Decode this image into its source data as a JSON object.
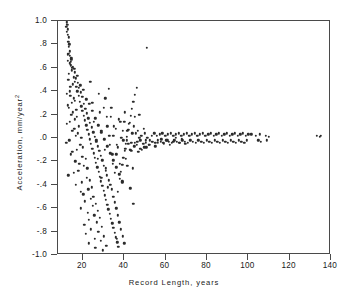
{
  "chart_data": {
    "type": "scatter",
    "title": "",
    "xlabel": "Record Length, years",
    "ylabel": "Acceleration, mm/year",
    "ylabel_superscript": "2",
    "xlim": [
      8,
      140
    ],
    "ylim": [
      -1.0,
      1.0
    ],
    "xticks": [
      20,
      40,
      60,
      80,
      100,
      120,
      140
    ],
    "xticklabels": [
      "20",
      "40",
      "60",
      "80",
      "100",
      "120",
      "140"
    ],
    "yticks": [
      1.0,
      0.8,
      0.6,
      0.4,
      0.2,
      0.0,
      -0.2,
      -0.4,
      -0.6,
      -0.8,
      -1.0
    ],
    "yticklabels": [
      "1.0",
      ".8",
      ".6",
      ".4",
      ".2",
      ".0",
      "-.2",
      "-.4",
      "-.6",
      "-.8",
      "-1.0"
    ],
    "grid": false,
    "legend": false,
    "marker_color": "#2b2b2b",
    "frame_color": "#4a4a4a",
    "background": "#ffffff",
    "x": [
      12.2,
      12.5,
      12.8,
      13.1,
      13.4,
      13.0,
      12.6,
      13.8,
      14.2,
      14.6,
      13.2,
      12.9,
      15.1,
      14.0,
      13.6,
      12.4,
      13.9,
      15.6,
      16.2,
      14.8,
      12.7,
      13.3,
      16.8,
      15.3,
      14.4,
      17.2,
      16.0,
      13.7,
      12.3,
      18.1,
      15.8,
      14.9,
      17.6,
      16.5,
      19.2,
      13.5,
      12.1,
      18.7,
      20.1,
      17.0,
      15.0,
      14.1,
      19.8,
      21.3,
      16.3,
      18.3,
      20.6,
      22.1,
      17.9,
      15.5,
      13.0,
      21.8,
      23.4,
      19.5,
      16.7,
      24.2,
      22.6,
      18.9,
      20.3,
      25.1,
      23.8,
      21.0,
      26.3,
      24.7,
      19.1,
      27.2,
      22.3,
      25.6,
      28.1,
      23.0,
      26.8,
      20.8,
      29.3,
      24.0,
      27.5,
      21.5,
      30.2,
      25.9,
      28.7,
      22.8,
      31.4,
      26.1,
      29.8,
      23.6,
      32.6,
      27.8,
      30.9,
      24.5,
      33.8,
      28.3,
      31.7,
      25.3,
      35.1,
      29.0,
      32.8,
      26.6,
      36.4,
      30.5,
      34.2,
      27.1,
      37.8,
      31.2,
      35.6,
      28.9,
      39.1,
      32.1,
      36.9,
      30.1,
      40.3,
      33.5,
      38.2,
      31.8,
      41.6,
      34.8,
      39.5,
      33.0,
      42.9,
      36.1,
      40.8,
      34.4,
      44.2,
      37.4,
      42.1,
      35.9,
      45.5,
      38.7,
      43.4,
      37.0,
      46.8,
      40.0,
      44.7,
      39.3,
      48.1,
      41.3,
      46.0,
      42.6,
      49.4,
      43.9,
      47.3,
      45.2,
      50.7,
      46.5,
      48.6,
      47.8,
      52.0,
      49.9,
      51.2,
      50.4,
      53.3,
      52.5,
      54.6,
      53.8,
      55.9,
      55.1,
      57.2,
      56.4,
      58.5,
      57.7,
      59.8,
      59.0,
      61.1,
      60.3,
      62.4,
      61.6,
      63.7,
      62.9,
      65.0,
      64.2,
      66.3,
      65.5,
      67.6,
      66.8,
      68.9,
      68.1,
      70.2,
      69.4,
      71.5,
      70.7,
      72.8,
      72.0,
      74.1,
      73.3,
      75.4,
      74.6,
      76.7,
      75.9,
      78.0,
      77.2,
      79.3,
      78.5,
      80.6,
      79.8,
      81.9,
      81.1,
      83.2,
      82.4,
      84.5,
      83.7,
      85.8,
      85.0,
      87.1,
      86.3,
      88.4,
      87.6,
      89.7,
      88.9,
      91.0,
      90.2,
      92.3,
      91.5,
      93.6,
      92.8,
      94.9,
      94.1,
      96.2,
      95.4,
      97.5,
      96.7,
      98.8,
      98.0,
      100.1,
      99.3,
      101.4,
      103.5,
      104.8,
      105.6,
      106.2,
      108.4,
      109.1,
      110.0,
      133.2,
      134.5,
      135.1,
      12.0,
      12.6,
      13.2,
      13.8,
      14.4,
      15.0,
      15.6,
      16.2,
      16.8,
      17.4,
      18.0,
      18.6,
      19.2,
      19.8,
      20.4,
      21.0,
      21.6,
      22.2,
      22.8,
      23.4,
      24.0,
      24.6,
      25.2,
      25.8,
      26.4,
      27.0,
      27.6,
      28.2,
      28.8,
      29.4,
      30.0,
      30.6,
      31.2,
      31.8,
      32.4,
      33.0,
      33.6,
      34.2,
      34.8,
      35.4,
      36.0,
      36.6,
      37.2,
      37.8,
      38.4,
      39.0,
      39.6,
      40.2,
      40.8,
      41.4,
      42.0,
      42.6,
      43.2,
      43.8,
      44.4,
      45.0,
      46.2,
      47.4,
      48.6,
      49.8,
      12.3,
      13.0,
      13.7,
      14.5,
      15.2,
      16.0,
      16.7,
      17.5,
      18.2,
      19.0,
      19.7,
      20.5,
      21.2,
      22.0,
      22.7,
      23.5,
      24.2,
      25.0,
      25.7,
      26.5,
      27.2,
      28.0,
      28.7,
      29.5,
      30.2,
      31.0,
      31.7,
      32.5,
      33.2,
      34.0,
      34.7,
      35.5,
      36.2,
      37.0,
      37.7,
      38.5,
      39.2,
      40.0,
      41.5,
      43.0,
      44.5,
      51.0,
      45.2,
      36.5,
      12.8,
      14.1,
      15.9,
      17.3,
      18.8,
      20.2,
      21.7,
      23.1,
      24.6,
      26.0,
      27.5,
      28.9,
      30.4,
      31.8,
      33.3,
      34.7,
      36.2,
      37.6,
      39.1,
      40.5,
      42.0,
      43.4,
      44.9,
      46.3,
      47.8,
      49.2,
      50.6,
      52.1,
      53.5,
      55.0,
      56.4,
      57.9,
      59.3,
      60.8,
      62.2,
      63.7,
      65.1,
      66.6,
      68.0,
      69.5
    ],
    "y": [
      0.99,
      0.97,
      0.93,
      0.86,
      0.8,
      0.72,
      0.66,
      0.64,
      0.62,
      0.58,
      0.55,
      0.5,
      0.46,
      0.44,
      0.4,
      0.38,
      0.36,
      0.34,
      0.32,
      0.3,
      0.28,
      0.26,
      0.24,
      0.22,
      0.2,
      0.18,
      0.16,
      0.14,
      0.12,
      0.1,
      0.08,
      0.06,
      0.04,
      0.02,
      0.0,
      -0.02,
      -0.04,
      -0.06,
      -0.08,
      -0.1,
      -0.12,
      -0.14,
      -0.16,
      -0.18,
      -0.2,
      -0.22,
      -0.24,
      -0.26,
      -0.28,
      -0.3,
      -0.32,
      -0.34,
      -0.36,
      -0.38,
      -0.4,
      -0.42,
      -0.44,
      -0.46,
      -0.48,
      -0.5,
      -0.52,
      -0.54,
      -0.56,
      -0.58,
      -0.6,
      -0.62,
      -0.64,
      -0.66,
      -0.68,
      -0.7,
      -0.72,
      -0.74,
      -0.76,
      -0.78,
      -0.8,
      -0.82,
      -0.84,
      -0.86,
      -0.88,
      -0.9,
      -0.92,
      -0.94,
      -0.96,
      0.48,
      0.42,
      0.38,
      0.34,
      0.3,
      0.26,
      0.22,
      0.18,
      0.14,
      0.1,
      0.06,
      0.02,
      -0.02,
      -0.06,
      -0.1,
      -0.14,
      -0.18,
      -0.22,
      -0.26,
      -0.3,
      -0.34,
      -0.38,
      -0.42,
      -0.46,
      0.26,
      0.22,
      0.18,
      0.14,
      0.1,
      0.06,
      0.02,
      -0.02,
      -0.06,
      -0.1,
      -0.14,
      -0.18,
      -0.22,
      -0.26,
      0.16,
      0.12,
      0.08,
      0.04,
      0.0,
      -0.04,
      -0.08,
      -0.12,
      0.14,
      0.1,
      0.06,
      0.02,
      -0.02,
      -0.06,
      -0.1,
      0.08,
      0.04,
      0.0,
      -0.04,
      -0.08,
      0.06,
      0.02,
      -0.02,
      -0.06,
      0.04,
      0.0,
      -0.04,
      0.02,
      -0.02,
      0.04,
      -0.03,
      0.02,
      -0.04,
      0.03,
      -0.02,
      0.04,
      -0.03,
      0.02,
      -0.04,
      0.03,
      -0.02,
      0.04,
      -0.03,
      0.02,
      -0.04,
      0.03,
      -0.02,
      0.04,
      -0.03,
      0.02,
      -0.04,
      0.03,
      -0.02,
      0.04,
      -0.03,
      0.02,
      -0.04,
      0.03,
      -0.02,
      0.04,
      -0.03,
      0.02,
      -0.04,
      0.03,
      -0.02,
      0.04,
      -0.03,
      0.02,
      -0.04,
      0.03,
      -0.02,
      0.04,
      -0.03,
      0.02,
      -0.04,
      0.03,
      -0.02,
      0.04,
      -0.03,
      0.02,
      -0.04,
      0.03,
      -0.02,
      0.04,
      -0.03,
      0.02,
      -0.04,
      0.03,
      -0.02,
      0.04,
      -0.03,
      0.02,
      -0.04,
      0.03,
      -0.02,
      0.04,
      -0.03,
      0.02,
      -0.04,
      0.03,
      -0.02,
      0.03,
      0.02,
      -0.02,
      0.03,
      -0.03,
      0.02,
      -0.02,
      0.01,
      0.02,
      0.01,
      0.02,
      0.95,
      0.88,
      0.78,
      0.7,
      0.68,
      0.6,
      0.52,
      0.48,
      0.44,
      0.4,
      0.36,
      0.31,
      0.27,
      0.23,
      0.19,
      0.15,
      0.11,
      0.07,
      0.03,
      -0.01,
      -0.05,
      -0.09,
      -0.13,
      -0.17,
      -0.21,
      -0.25,
      -0.29,
      -0.33,
      -0.37,
      -0.41,
      -0.45,
      -0.49,
      -0.53,
      -0.57,
      -0.61,
      -0.65,
      -0.69,
      -0.73,
      -0.77,
      -0.81,
      -0.85,
      -0.89,
      -0.93,
      -0.35,
      -0.29,
      -0.23,
      -0.17,
      -0.11,
      -0.05,
      0.01,
      0.07,
      0.13,
      0.19,
      0.25,
      0.31,
      0.37,
      0.43,
      0.2,
      -0.1,
      -0.08,
      0.91,
      0.82,
      0.74,
      0.67,
      0.61,
      0.56,
      0.51,
      0.47,
      0.43,
      0.39,
      0.35,
      0.29,
      0.25,
      0.21,
      0.17,
      0.13,
      0.09,
      0.05,
      0.01,
      -0.03,
      -0.07,
      -0.11,
      -0.15,
      -0.19,
      -0.24,
      -0.28,
      -0.32,
      -0.36,
      -0.4,
      -0.44,
      -0.5,
      -0.55,
      -0.6,
      -0.66,
      -0.72,
      -0.78,
      -0.84,
      -0.9,
      -0.24,
      -0.43,
      -0.56,
      0.77,
      0.18,
      -0.86,
      0.71,
      0.65,
      0.59,
      0.53,
      0.45,
      0.41,
      0.33,
      0.29,
      0.23,
      0.17,
      0.11,
      0.05,
      -0.01,
      -0.07,
      -0.13,
      -0.19,
      -0.25,
      -0.31,
      -0.37,
      -0.09,
      -0.05,
      -0.11,
      -0.07,
      -0.03,
      -0.09,
      -0.05,
      -0.02,
      -0.06,
      -0.03,
      -0.07,
      -0.04,
      -0.01,
      -0.05,
      -0.02,
      -0.06,
      -0.03,
      0.0,
      -0.04,
      -0.01,
      -0.05
    ]
  }
}
